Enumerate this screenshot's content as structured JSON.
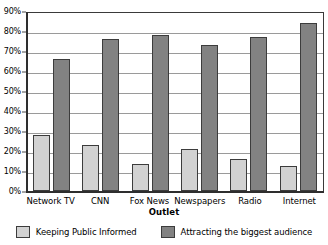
{
  "chart_data": {
    "type": "bar",
    "title": "",
    "xlabel": "Outlet",
    "ylabel": "",
    "categories": [
      "Network TV",
      "CNN",
      "Fox News",
      "Newspapers",
      "Radio",
      "Internet"
    ],
    "series": [
      {
        "name": "Keeping Public Informed",
        "color": "#d2d2d2",
        "values": [
          28,
          23,
          13.5,
          21,
          16,
          12.5
        ]
      },
      {
        "name": "Attracting the biggest audience",
        "color": "#828282",
        "values": [
          66,
          76,
          78,
          73,
          77,
          84
        ]
      }
    ],
    "ylim": [
      0,
      90
    ],
    "ytick_values": [
      0,
      10,
      20,
      30,
      40,
      50,
      60,
      70,
      80,
      90
    ],
    "ytick_labels": [
      "0%",
      "10%",
      "20%",
      "30%",
      "40%",
      "50%",
      "60%",
      "70%",
      "80%",
      "90%"
    ],
    "grid": "horizontal",
    "legend_position": "bottom"
  }
}
